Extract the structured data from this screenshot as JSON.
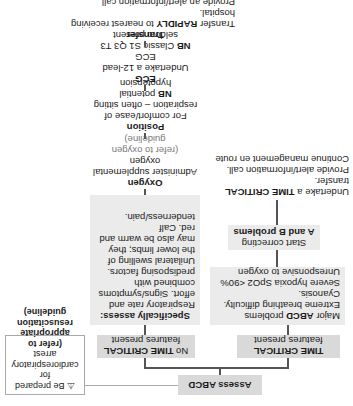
{
  "assess": {
    "label": "Assess ABCD"
  },
  "callout": {
    "icon": "warning-icon",
    "text_1": "Be prepared for cardiorespiratory arrest",
    "text_2": "(refer to appropriate resuscitation guideline)"
  },
  "time_critical": {
    "header_bold": "TIME CRITICAL",
    "header_rest": "features present",
    "problems_prefix": "Major",
    "problems_bold": "ABCD",
    "problems_suffix": "problems",
    "items": [
      "Extreme breathing difficulty.",
      "Cyanosis.",
      "Severe hypoxia SpO2 <90%",
      "Unresponsive to oxygen"
    ],
    "start_correcting": "Start correcting",
    "start_bold": "A and B problems",
    "undertake_prefix": "Undertake a",
    "undertake_bold": "TIME CRITICAL",
    "undertake_suffix": "transfer.",
    "undertake_line2": "Provide alert/information call.",
    "undertake_line3": "Continue management en route"
  },
  "non_critical": {
    "header_prefix": "No",
    "header_bold": "TIME CRITICAL",
    "header_rest": "features present",
    "assess_title": "Specifically assess:",
    "assess_text": "Respiratory rate and effort. Signs/symptoms combined with predisposing factors. Unilateral swelling of the lower limbs; they may also be warm and red. Calf tenderness/pain."
  },
  "oxygen": {
    "title": "Oxygen",
    "text": "Administer supplemental oxygen",
    "ref": "(refer to oxygen guideline)"
  },
  "position": {
    "title": "Position",
    "text": "For comfort/ease of respiration – often sitting",
    "nb": "NB",
    "nb_text": "potential hypotension"
  },
  "ecg": {
    "title": "ECG",
    "text": "Undertake a 12-lead ECG",
    "nb": "NB",
    "nb_text": "Classic S1 Q3 T3 seldom present"
  },
  "transfer": {
    "title": "Transfer",
    "line1_prefix": "Transfer",
    "line1_bold": "RAPIDLY",
    "line1_suffix": "to nearest receiving hospital.",
    "line2": "Provide an alert/information call.",
    "line3": "Continue patient management en route"
  }
}
